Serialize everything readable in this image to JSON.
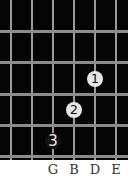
{
  "diagram": {
    "type": "guitar-chord-fingering",
    "strings_x": [
      11,
      32,
      53,
      74,
      95,
      116
    ],
    "frets_y": [
      31,
      62,
      94,
      125,
      156
    ],
    "fingers": [
      {
        "label": "1",
        "x": 95,
        "y": 79,
        "style": "light"
      },
      {
        "label": "2",
        "x": 74,
        "y": 110,
        "style": "light"
      },
      {
        "label": "3",
        "x": 53,
        "y": 141,
        "style": "dark"
      }
    ],
    "string_labels": [
      {
        "text": "G",
        "x": 53
      },
      {
        "text": "B",
        "x": 74
      },
      {
        "text": "D",
        "x": 95
      },
      {
        "text": "E",
        "x": 116
      }
    ],
    "colors": {
      "background": "#050505",
      "lines": "#9a9a9a",
      "dot": "#e6e6e6"
    }
  }
}
